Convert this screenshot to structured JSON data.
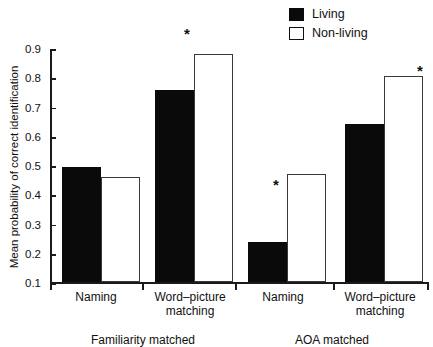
{
  "chart_data": {
    "type": "bar",
    "title": "",
    "xlabel": "",
    "ylabel": "Mean probability of correct identification",
    "ylim": [
      0.1,
      0.9
    ],
    "ytick_labels": [
      "0.9",
      "0.8",
      "0.7",
      "0.6",
      "0.5",
      "0.4",
      "0.3",
      "0.2",
      "0.1"
    ],
    "ytick_values": [
      0.9,
      0.8,
      0.7,
      0.6,
      0.5,
      0.4,
      0.3,
      0.2,
      0.1
    ],
    "grid": false,
    "legend_position": "top-right",
    "groups": [
      {
        "group_label": "Familiarity matched",
        "categories": [
          "Naming",
          "Word–picture matching"
        ]
      },
      {
        "group_label": "AOA matched",
        "categories": [
          "Naming",
          "Word–picture matching"
        ]
      }
    ],
    "categories": [
      "Naming",
      "Word–picture matching",
      "Naming",
      "Word–picture matching"
    ],
    "series": [
      {
        "name": "Living",
        "color": "#0a0a0a",
        "fill": "solid",
        "values": [
          0.495,
          0.757,
          0.237,
          0.64
        ]
      },
      {
        "name": "Non-living",
        "color": "#ffffff",
        "fill": "open",
        "values": [
          0.46,
          0.88,
          0.47,
          0.805
        ]
      }
    ],
    "annotations": [
      {
        "symbol": "*",
        "category_index": 1,
        "group": "Familiarity matched",
        "meaning": "significant difference"
      },
      {
        "symbol": "*",
        "category_index": 2,
        "group": "AOA matched",
        "meaning": "significant difference"
      },
      {
        "symbol": "*",
        "category_index": 3,
        "group": "AOA matched",
        "meaning": "significant difference"
      }
    ]
  },
  "legend": {
    "items": [
      {
        "label": "Living",
        "swatch": "filled-square"
      },
      {
        "label": "Non-living",
        "swatch": "open-square"
      }
    ]
  },
  "axis": {
    "y_title": "Mean probability of correct identification",
    "y_ticks": [
      "0.9",
      "0.8",
      "0.7",
      "0.6",
      "0.5",
      "0.4",
      "0.3",
      "0.2",
      "0.1"
    ]
  },
  "x_axis": {
    "category_labels": [
      "Naming",
      "Word–picture\nmatching",
      "Naming",
      "Word–picture\nmatching"
    ],
    "category_line1": [
      "Naming",
      "Word–picture",
      "Naming",
      "Word–picture"
    ],
    "category_line2": [
      "",
      "matching",
      "",
      "matching"
    ],
    "group_labels": [
      "Familiarity matched",
      "AOA matched"
    ]
  },
  "stars": {
    "symbol": "*"
  }
}
